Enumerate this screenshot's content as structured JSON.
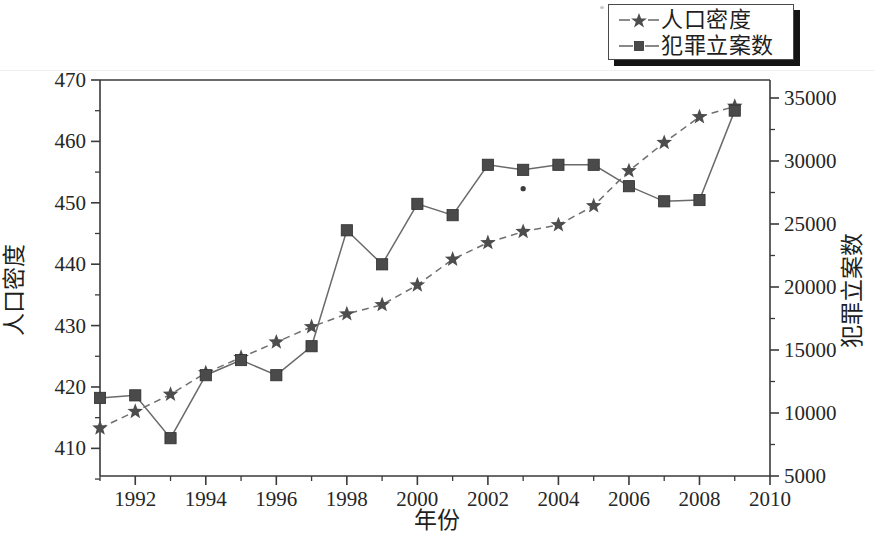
{
  "chart_data": {
    "type": "line",
    "title": "",
    "xlabel": "年份",
    "ylabel": "人口密度",
    "y2label": "犯罪立案数",
    "grid": false,
    "legend_position": "top-right",
    "xlim": [
      1991,
      2010
    ],
    "ylim": [
      405.5,
      470
    ],
    "y2lim": [
      5000,
      35000
    ],
    "x": [
      1991,
      1992,
      1993,
      1994,
      1995,
      1996,
      1997,
      1998,
      1999,
      2000,
      2001,
      2002,
      2003,
      2004,
      2005,
      2006,
      2007,
      2008,
      2009
    ],
    "xticks": [
      1992,
      1994,
      1996,
      1998,
      2000,
      2002,
      2004,
      2006,
      2008,
      2010
    ],
    "xtick_labels": [
      "1992",
      "1994",
      "1996",
      "1998",
      "2000",
      "2002",
      "2004",
      "2006",
      "2008",
      "2010"
    ],
    "yticks": [
      410,
      420,
      430,
      440,
      450,
      460,
      470
    ],
    "ytick_labels": [
      "410",
      "420",
      "430",
      "440",
      "450",
      "460",
      "470"
    ],
    "y2ticks": [
      5000,
      10000,
      15000,
      20000,
      25000,
      30000,
      35000
    ],
    "y2tick_labels": [
      "5000",
      "10000",
      "15000",
      "20000",
      "25000",
      "30000",
      "35000"
    ],
    "series": [
      {
        "name": "人口密度",
        "axis": "left",
        "marker": "star",
        "linestyle": "dashed",
        "color": "#4d4d4d",
        "values": [
          413.3,
          416.0,
          418.8,
          422.3,
          424.8,
          427.3,
          429.8,
          431.9,
          433.4,
          436.6,
          440.8,
          443.5,
          445.3,
          446.4,
          449.5,
          455.2,
          459.8,
          464.0,
          465.7
        ]
      },
      {
        "name": "犯罪立案数",
        "axis": "right",
        "marker": "square",
        "linestyle": "solid",
        "color": "#4a4a4a",
        "values": [
          11200,
          11400,
          8000,
          13000,
          14200,
          13000,
          15300,
          24500,
          21800,
          26600,
          25700,
          29700,
          29300,
          29700,
          29700,
          28000,
          26800,
          26900,
          34000
        ]
      }
    ],
    "annotations": [
      {
        "name": "stray-dot",
        "x": 2003,
        "y2": 27800
      }
    ]
  },
  "legend": {
    "entries": [
      {
        "label": "人口密度",
        "marker": "star-marker",
        "linestyle": "dashed"
      },
      {
        "label": "犯罪立案数",
        "marker": "square-marker",
        "linestyle": "solid"
      }
    ]
  }
}
